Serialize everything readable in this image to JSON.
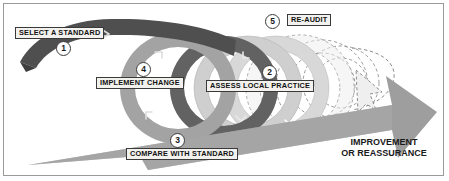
{
  "figure": {
    "background_color": "#ffffff",
    "frame_color": "#9a9a9a"
  },
  "palette": {
    "band_dark": "#4a4a4a",
    "band_mid": "#9d9d9d",
    "band_light": "#c9c9c9",
    "band_pale": "#e0e0e0",
    "arrow_gray": "#9b9b9b",
    "dashed_outline": "#8e8e8e",
    "label_fill": "#f2f1ee",
    "label_border": "#3a3a3a",
    "text_color": "#111111"
  },
  "stages": [
    {
      "number": "1",
      "label": "SELECT A STANDARD"
    },
    {
      "number": "2",
      "label": "ASSESS LOCAL PRACTICE"
    },
    {
      "number": "3",
      "label": "COMPARE WITH STANDARD"
    },
    {
      "number": "4",
      "label": "IMPLEMENT CHANGE"
    },
    {
      "number": "5",
      "label": "RE-AUDIT"
    }
  ],
  "outcome": {
    "line1": "IMPROVEMENT",
    "line2": "OR REASSURANCE"
  }
}
